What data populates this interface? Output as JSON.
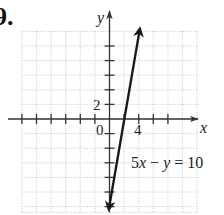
{
  "problem": {
    "number_label": "9."
  },
  "chart_data": {
    "type": "line",
    "title": "",
    "xlabel": "x",
    "ylabel": "y",
    "xlim": [
      -12,
      12
    ],
    "ylim": [
      -12.8,
      12
    ],
    "tick_step": 2,
    "labeled_ticks": {
      "x": [
        {
          "value": 4,
          "label": "4"
        }
      ],
      "y": [
        {
          "value": 2,
          "label": "2"
        }
      ],
      "origin": "0"
    },
    "grid": true,
    "grid_style": "dotted",
    "series": [
      {
        "name": "5x − y = 10",
        "equation": "5x − y = 10",
        "slope": 5,
        "intercept": -10,
        "x": [
          -0.1,
          4.1
        ],
        "y": [
          -10.5,
          10.5
        ],
        "arrows_both_ends": true
      }
    ],
    "annotations": [
      {
        "text": "5x − y = 10",
        "x": 4.5,
        "y": -5
      }
    ]
  },
  "labels": {
    "x_axis": "x",
    "y_axis": "y",
    "origin": "0",
    "tick_x_4": "4",
    "tick_y_2": "2",
    "eq_part1": "5",
    "eq_var_x": "x",
    "eq_minus": " − ",
    "eq_var_y": "y",
    "eq_rest": " = 10"
  }
}
